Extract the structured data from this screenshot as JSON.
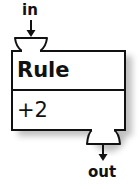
{
  "node": {
    "title": "Rule",
    "body": "+2"
  },
  "ports": {
    "input": {
      "label": "in"
    },
    "output": {
      "label": "out"
    }
  },
  "colors": {
    "stroke": "#111111",
    "fill": "#ffffff",
    "shadow": "#9a9a9a"
  }
}
